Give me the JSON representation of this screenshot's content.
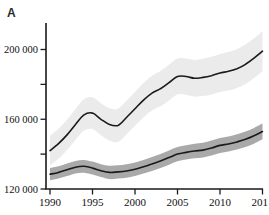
{
  "panel_label": "A",
  "colors": {
    "axis": "#1a1a1a",
    "series1_line": "#1a1a1a",
    "series1_band": "#ebebeb",
    "series2_line": "#1a1a1a",
    "series2_band": "#a9a9a9",
    "background": "#ffffff",
    "tick_text": "#111111"
  },
  "chart_data": {
    "type": "line",
    "title": "",
    "xlabel": "",
    "ylabel": "",
    "grid": false,
    "legend": null,
    "xlim": [
      1990,
      2015
    ],
    "ylim": [
      120000,
      215000
    ],
    "x_ticks": [
      1990,
      1995,
      2000,
      2005,
      2010,
      2015
    ],
    "x_tick_labels": [
      "1990",
      "1995",
      "2000",
      "2005",
      "2010",
      "2015"
    ],
    "y_ticks_major": [
      120000,
      160000,
      200000
    ],
    "y_tick_labels": [
      "120 000",
      "160 000",
      "200 000"
    ],
    "y_ticks_minor": [
      140000,
      180000
    ],
    "x": [
      1990,
      1991,
      1992,
      1993,
      1994,
      1995,
      1996,
      1997,
      1998,
      1999,
      2000,
      2001,
      2002,
      2003,
      2004,
      2005,
      2006,
      2007,
      2008,
      2009,
      2010,
      2011,
      2012,
      2013,
      2014,
      2015
    ],
    "series": [
      {
        "name": "upper-series-with-confidence-band",
        "values": [
          142000,
          146000,
          151000,
          157000,
          162500,
          163500,
          160000,
          157000,
          156500,
          161000,
          166000,
          171000,
          175000,
          177500,
          181000,
          184500,
          184500,
          183500,
          184000,
          185000,
          186500,
          187500,
          189000,
          191500,
          195000,
          199000
        ],
        "band_upper": [
          150500,
          154600,
          159700,
          165900,
          171500,
          172600,
          169200,
          166300,
          166000,
          170600,
          175700,
          180800,
          184900,
          187600,
          191200,
          194800,
          194900,
          194000,
          194700,
          195800,
          197400,
          198500,
          200100,
          202800,
          206400,
          210500
        ],
        "band_lower": [
          133500,
          137400,
          142300,
          148100,
          153500,
          154400,
          150800,
          147700,
          147000,
          151400,
          156300,
          161200,
          165100,
          167400,
          170800,
          174200,
          174100,
          173000,
          173300,
          174200,
          175600,
          176500,
          177900,
          180200,
          183600,
          187500
        ]
      },
      {
        "name": "lower-series-with-confidence-band",
        "values": [
          128500,
          129500,
          131000,
          132500,
          133000,
          132000,
          130500,
          129500,
          129800,
          130300,
          131300,
          132800,
          134300,
          136000,
          138000,
          140000,
          141000,
          141800,
          142300,
          143500,
          145000,
          145800,
          147000,
          148500,
          150500,
          153000
        ],
        "band_upper": [
          132000,
          133000,
          134600,
          136100,
          136700,
          135700,
          134200,
          133300,
          133600,
          134200,
          135200,
          136700,
          138300,
          140000,
          142100,
          144100,
          145100,
          146000,
          146500,
          147800,
          149300,
          150100,
          151400,
          152900,
          155000,
          157500
        ],
        "band_lower": [
          125000,
          126000,
          127400,
          128900,
          129300,
          128300,
          126800,
          125700,
          126000,
          126400,
          127400,
          128900,
          130300,
          132000,
          133900,
          135900,
          136900,
          137600,
          138100,
          139200,
          140700,
          141500,
          142600,
          144100,
          146000,
          148500
        ]
      }
    ]
  }
}
